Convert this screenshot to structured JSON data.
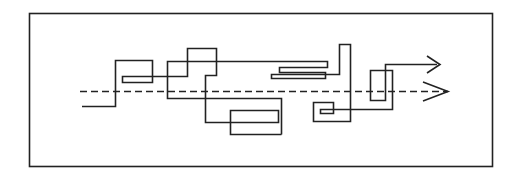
{
  "diagram": {
    "width": 516,
    "height": 178,
    "stroke_color": "#222222",
    "background": "#ffffff",
    "frame": {
      "x": 29.5,
      "y": 13.5,
      "width": 463,
      "height": 153
    },
    "baseline": {
      "style": "dashed",
      "y": 91.5,
      "x_start": 80,
      "x_end": 448,
      "dash": "7,4",
      "arrowhead": "M423,82 L448,91.5 L423,101"
    },
    "main_path": {
      "style": "solid",
      "points": "82,106.5 115.5,106.5 115.5,60.5 152.5,60.5 152.5,82.5 122.5,82.5 122.5,76.5 187.5,76.5 187.5,48.5 216.5,48.5 216.5,75.5 205.5,75.5 205.5,122.5 278.5,122.5 278.5,110.5 230.5,110.5 230.5,134.5 281.5,134.5",
      "comment": "first segment of the wandering route"
    },
    "second_path": {
      "style": "solid",
      "points": "167.5,98.5 281.5,98.5 281.5,134.5 281.5,98.5 167.5,98.5 167.5,61.5 327.5,61.5 327.5,67.5 279.5,67.5 279.5,72.5 325.5,72.5 325.5,78.5 271.5,78.5 271.5,74.5 339.5,74.5 339.5,44.5 350.5,44.5 350.5,121.5 313.5,121.5 313.5,102.5 333.5,102.5 333.5,113.5 320.5,113.5 320.5,109.5 392.5,109.5 392.5,70.5 370.5,70.5 370.5,100.5 385.5,100.5 385.5,64.5 437,64.5",
      "arrowhead": "M427,56 L440,64.5 L427,73"
    }
  }
}
